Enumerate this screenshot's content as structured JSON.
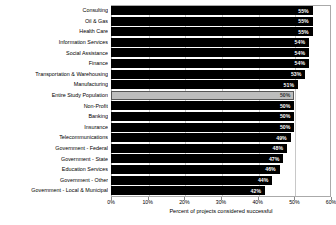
{
  "chart_data": {
    "type": "bar",
    "orientation": "horizontal",
    "title": "",
    "xlabel": "Percent of projects considered successful",
    "ylabel": "",
    "xlim": [
      0,
      60
    ],
    "xticks": [
      "0%",
      "10%",
      "20%",
      "30%",
      "40%",
      "50%",
      "60%"
    ],
    "xtick_values": [
      0,
      10,
      20,
      30,
      40,
      50,
      60
    ],
    "grid": true,
    "legend": "none",
    "categories": [
      "Consulting",
      "Oil & Gas",
      "Health Care",
      "Information Services",
      "Social Assistance",
      "Finance",
      "Transportation & Warehousing",
      "Manufacturing",
      "Entire Study Population",
      "Non-Profit",
      "Banking",
      "Insurance",
      "Telecommunications",
      "Government - Federal",
      "Government - State",
      "Education Services",
      "Government - Other",
      "Government - Local & Municipal"
    ],
    "values": [
      55,
      55,
      55,
      54,
      54,
      54,
      53,
      51,
      50,
      50,
      50,
      50,
      49,
      48,
      47,
      46,
      44,
      42
    ],
    "value_labels": [
      "55%",
      "55%",
      "55%",
      "54%",
      "54%",
      "54%",
      "53%",
      "51%",
      "50%",
      "50%",
      "50%",
      "50%",
      "49%",
      "48%",
      "47%",
      "46%",
      "44%",
      "42%"
    ],
    "highlight_index": 8,
    "bar_color": "#000000",
    "highlight_color": "#bdbdbd",
    "value_label_color": "#ffffff",
    "grid_color": "#c8c8c8",
    "frame_color": "#aaaaaa"
  }
}
